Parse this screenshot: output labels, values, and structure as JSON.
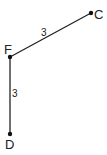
{
  "diagram": {
    "points": {
      "F": {
        "label": "F",
        "x": 10,
        "y": 57
      },
      "C": {
        "label": "C",
        "x": 91,
        "y": 13
      },
      "D": {
        "label": "D",
        "x": 10,
        "y": 134
      }
    },
    "segments": [
      {
        "from": "F",
        "to": "C",
        "length_label": "3"
      },
      {
        "from": "F",
        "to": "D",
        "length_label": "3"
      }
    ],
    "colors": {
      "line": "#222222",
      "point": "#111111"
    }
  }
}
